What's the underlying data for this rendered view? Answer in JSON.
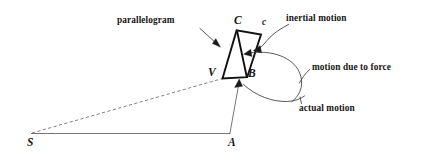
{
  "figure": {
    "background_color": "#ffffff",
    "ink_color": "#1a1a1a",
    "width": 425,
    "height": 162
  },
  "annotations": {
    "parallelogram": "parallelogram",
    "inertial_motion": "inertial motion",
    "motion_due_to_force": "motion due to force",
    "actual_motion": "actual motion"
  },
  "points": {
    "S": "S",
    "A": "A",
    "B": "B",
    "C": "C",
    "c_lower": "c",
    "V": "V"
  },
  "geometry": {
    "S": [
      31,
      133
    ],
    "A": [
      230,
      133
    ],
    "V": [
      222,
      78
    ],
    "B": [
      247,
      76
    ],
    "C": [
      238,
      29
    ],
    "c": [
      261,
      33
    ],
    "baseline": "S to A",
    "dashed_line": "S to V",
    "radius_line": "A to B",
    "parallelogram_vertices": "V, C, c, B",
    "diagonal": "C to B"
  }
}
